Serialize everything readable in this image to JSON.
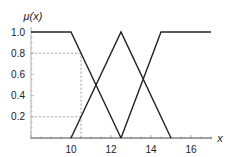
{
  "chart_data": {
    "type": "line",
    "title": "",
    "xlabel": "x",
    "ylabel": "μ(x)",
    "xlim": [
      8,
      17.1
    ],
    "ylim": [
      0,
      1.0
    ],
    "xticks": [
      10,
      12,
      14,
      16
    ],
    "xtick_labels": [
      "10",
      "12",
      "14",
      "16"
    ],
    "yticks": [
      0.2,
      0.4,
      0.6,
      0.8,
      1.0
    ],
    "ytick_labels": [
      "0.2",
      "0.4",
      "0.6",
      "0.8",
      "1.0"
    ],
    "grid": false,
    "series": [
      {
        "name": "left-shoulder",
        "x": [
          8,
          10,
          12.5
        ],
        "y": [
          1,
          1,
          0
        ]
      },
      {
        "name": "triangle-middle",
        "x": [
          10,
          12.5,
          15
        ],
        "y": [
          0,
          1,
          0
        ]
      },
      {
        "name": "right-shoulder",
        "x": [
          12.5,
          14.5,
          17
        ],
        "y": [
          0,
          1,
          1
        ]
      }
    ],
    "annotations": [
      {
        "type": "dashed-vertical",
        "x": 10.5,
        "y_from": 0,
        "y_to": 0.8
      },
      {
        "type": "dashed-horizontal",
        "y": 0.8,
        "x_from": 8,
        "x_to": 10.5
      },
      {
        "type": "dashed-horizontal",
        "y": 0.2,
        "x_from": 8,
        "x_to": 10.5
      }
    ]
  }
}
